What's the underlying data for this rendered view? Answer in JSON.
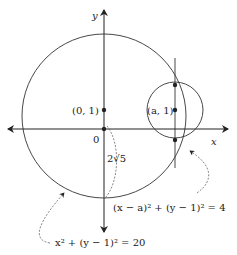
{
  "axes": {
    "x_label": "x",
    "y_label": "y",
    "origin_label": "0"
  },
  "points": {
    "center_big": "(0, 1)",
    "center_small": "(a, 1)"
  },
  "annotations": {
    "radius_big": "2√5",
    "eq_small": "(x − a)² + (y − 1)² = 4",
    "eq_big": "x² + (y − 1)² = 20"
  },
  "colors": {
    "stroke": "#222222",
    "background": "#ffffff"
  }
}
